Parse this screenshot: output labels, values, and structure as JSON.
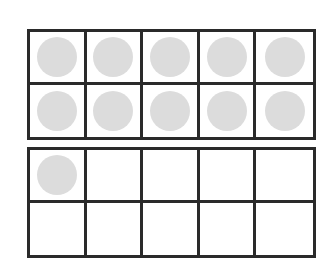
{
  "diagram": {
    "type": "ten-frame",
    "frames": [
      {
        "name": "frame-1",
        "rows": 2,
        "columns": 5,
        "filled": [
          true,
          true,
          true,
          true,
          true,
          true,
          true,
          true,
          true,
          true
        ]
      },
      {
        "name": "frame-2",
        "rows": 2,
        "columns": 5,
        "filled": [
          true,
          false,
          false,
          false,
          false,
          false,
          false,
          false,
          false,
          false
        ]
      }
    ],
    "total_counters": 11,
    "counter_color": "#dcdcdc",
    "line_color": "#2a2a2a"
  }
}
